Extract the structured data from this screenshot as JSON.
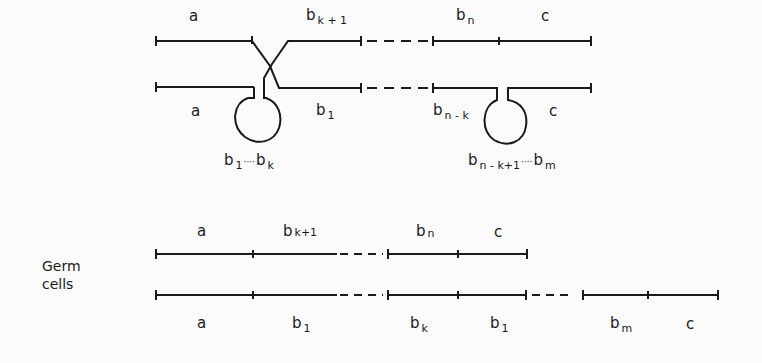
{
  "diagram": {
    "top": {
      "row1_labels": {
        "a": "a",
        "bk1_base": "b",
        "bk1_sub": "k + 1",
        "bn_base": "b",
        "bn_sub": "n",
        "c": "c"
      },
      "row2_labels": {
        "a": "a",
        "b1_base": "b",
        "b1_sub": "1",
        "bnk_base": "b",
        "bnk_sub": "n - k",
        "c": "c"
      },
      "loop1_label": {
        "b1_base": "b",
        "b1_sub": "1",
        "dots": "····",
        "bk_base": "b",
        "bk_sub": "k"
      },
      "loop2_label": {
        "b_base": "b",
        "b_sub": "n - k+1",
        "dots": "····",
        "bm_base": "b",
        "bm_sub": "m"
      }
    },
    "germ": {
      "side_label_1": "Germ",
      "side_label_2": "cells",
      "row1_labels": {
        "a": "a",
        "bk1_base": "b",
        "bk1_sub": "k+1",
        "bn_base": "b",
        "bn_sub": "n",
        "c": "c"
      },
      "row2_labels": {
        "a": "a",
        "b1_base": "b",
        "b1_sub": "1",
        "bk_base": "b",
        "bk_sub": "k",
        "b1b_base": "b",
        "b1b_sub": "1",
        "bm_base": "b",
        "bm_sub": "m",
        "c": "c"
      }
    },
    "line_color": "#1a1a1a"
  }
}
